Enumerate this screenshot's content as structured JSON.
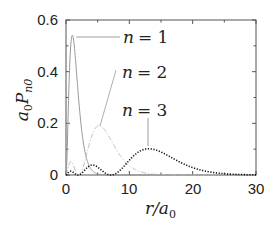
{
  "chart_data": {
    "type": "line",
    "title": "",
    "xlabel": "r/a0",
    "ylabel": "a0 P_n0",
    "xlim": [
      0,
      30
    ],
    "ylim": [
      0,
      0.6
    ],
    "grid": false,
    "legend": "inline annotations with leader lines",
    "x_ticks": [
      "0",
      "10",
      "20",
      "30"
    ],
    "y_ticks": [
      "0",
      "0.2",
      "0.4",
      "0.6"
    ],
    "series": [
      {
        "name": "n = 1",
        "style": "solid gray",
        "peak": {
          "x": 1.0,
          "y": 0.54
        }
      },
      {
        "name": "n = 2",
        "style": "dash-dot light gray",
        "peak": {
          "x": 5.2,
          "y": 0.19
        }
      },
      {
        "name": "n = 3",
        "style": "dotted black",
        "peak": {
          "x": 13.1,
          "y": 0.1
        }
      }
    ],
    "annotations": [
      "n = 1",
      "n = 2",
      "n = 3"
    ]
  },
  "axes": {
    "xlabel_main": "r/a",
    "xlabel_sub": "0",
    "ylabel_a": "a",
    "ylabel_a_sub": "0",
    "ylabel_P": "P",
    "ylabel_P_sub": "n0",
    "xticks": [
      "0",
      "10",
      "20",
      "30"
    ],
    "yticks": [
      "0",
      "0.2",
      "0.4",
      "0.6"
    ]
  },
  "labels": {
    "n1": {
      "var": "n",
      "eq": "= 1"
    },
    "n2": {
      "var": "n",
      "eq": "= 2"
    },
    "n3": {
      "var": "n",
      "eq": "= 3"
    }
  }
}
